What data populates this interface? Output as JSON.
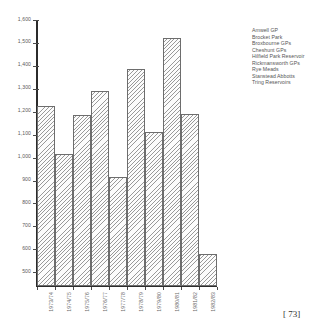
{
  "chart_data": {
    "type": "bar",
    "title": "",
    "xlabel": "",
    "ylabel": "",
    "grid": false,
    "legend_position": "top-right",
    "ylim": [
      440,
      1600
    ],
    "yticks": [
      500,
      600,
      700,
      800,
      900,
      1000,
      1100,
      1200,
      1300,
      1400,
      1500,
      1600
    ],
    "ytick_labels": [
      "500",
      "600",
      "700",
      "800",
      "900",
      "1,000",
      "1,100",
      "1,200",
      "1,300",
      "1,400",
      "1,500",
      "1,600"
    ],
    "categories": [
      "1973/74",
      "1974/75",
      "1975/76",
      "1976/77",
      "1977/78",
      "1978/79",
      "1979/80",
      "1980/81",
      "1981/82",
      "1982/83"
    ],
    "values": [
      1225,
      1015,
      1185,
      1290,
      915,
      1385,
      1110,
      1520,
      1190,
      580
    ],
    "legend_entries": [
      "Amwell GP",
      "Brocket Park",
      "Broxbourne GPs",
      "Cheshunt GPs",
      "Hilfield Park Reservoir",
      "Rickmansworth GPs",
      "Rye Meads",
      "Stanstead Abbotts",
      "Tring Reservoirs"
    ],
    "bar_fill": "hatched-diagonal",
    "bar_edge_color": "#6d6d6d",
    "axis_color": "#2b2b2b",
    "text_color": "#5a5a5a"
  },
  "page": {
    "folio": "[ 73]"
  }
}
